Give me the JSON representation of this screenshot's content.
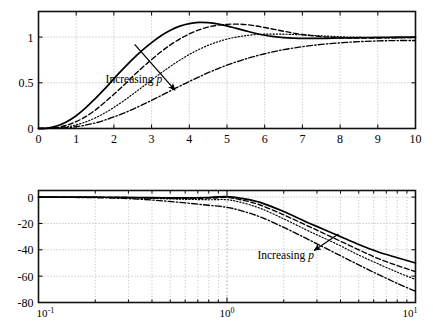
{
  "figure": {
    "title": "",
    "background": "#ffffff",
    "line_color": "#000000",
    "grid_color": "#aaaaaa"
  },
  "annotations": {
    "increasing_label": "Increasing",
    "increasing_param": "p"
  },
  "chart_data": [
    {
      "type": "line",
      "id": "step-response",
      "title": "",
      "xlabel": "",
      "ylabel": "",
      "xlim": [
        0,
        10
      ],
      "ylim": [
        0,
        1.28
      ],
      "grid": true,
      "legend": "none",
      "xticks": [
        0,
        1,
        2,
        3,
        4,
        5,
        6,
        7,
        8,
        9,
        10
      ],
      "xticklabels": [
        "0",
        "1",
        "2",
        "3",
        "4",
        "5",
        "6",
        "7",
        "8",
        "9",
        "10"
      ],
      "yticks": [
        0,
        0.5,
        1
      ],
      "yticklabels": [
        "0",
        "0.5",
        "1"
      ],
      "annotation": {
        "text": "Increasing p",
        "x": 2.55,
        "y": 0.62,
        "arrow_to_x": 3.62,
        "arrow_to_y": 0.42
      },
      "series": [
        {
          "name": "p1",
          "style": "solid",
          "x": [
            0,
            0.25,
            0.5,
            0.75,
            1.0,
            1.25,
            1.5,
            1.75,
            2.0,
            2.25,
            2.5,
            2.75,
            3.0,
            3.25,
            3.5,
            3.75,
            4.0,
            4.25,
            4.5,
            4.75,
            5.0,
            5.25,
            5.5,
            5.75,
            6.0,
            6.25,
            6.5,
            6.75,
            7.0,
            7.5,
            8.0,
            8.5,
            9.0,
            9.5,
            10.0
          ],
          "y": [
            0,
            0.005,
            0.03,
            0.075,
            0.14,
            0.225,
            0.325,
            0.43,
            0.545,
            0.655,
            0.76,
            0.855,
            0.94,
            1.015,
            1.075,
            1.12,
            1.148,
            1.16,
            1.158,
            1.145,
            1.122,
            1.095,
            1.068,
            1.042,
            1.02,
            1.005,
            0.995,
            0.989,
            0.986,
            0.986,
            0.99,
            0.994,
            0.997,
            0.999,
            1.0
          ]
        },
        {
          "name": "p2",
          "style": "dashed",
          "x": [
            0,
            0.25,
            0.5,
            0.75,
            1.0,
            1.25,
            1.5,
            1.75,
            2.0,
            2.25,
            2.5,
            2.75,
            3.0,
            3.25,
            3.5,
            3.75,
            4.0,
            4.25,
            4.5,
            4.75,
            5.0,
            5.25,
            5.5,
            5.75,
            6.0,
            6.25,
            6.5,
            6.75,
            7.0,
            7.5,
            8.0,
            8.5,
            9.0,
            9.5,
            10.0
          ],
          "y": [
            0,
            0.002,
            0.012,
            0.035,
            0.075,
            0.13,
            0.2,
            0.285,
            0.375,
            0.47,
            0.57,
            0.665,
            0.755,
            0.84,
            0.915,
            0.98,
            1.035,
            1.078,
            1.11,
            1.13,
            1.14,
            1.142,
            1.136,
            1.123,
            1.105,
            1.085,
            1.064,
            1.045,
            1.028,
            1.005,
            0.993,
            0.989,
            0.99,
            0.993,
            0.996
          ]
        },
        {
          "name": "p3",
          "style": "dotted",
          "x": [
            0,
            0.25,
            0.5,
            0.75,
            1.0,
            1.25,
            1.5,
            1.75,
            2.0,
            2.25,
            2.5,
            2.75,
            3.0,
            3.25,
            3.5,
            3.75,
            4.0,
            4.25,
            4.5,
            4.75,
            5.0,
            5.25,
            5.5,
            5.75,
            6.0,
            6.5,
            7.0,
            7.5,
            8.0,
            8.5,
            9.0,
            9.5,
            10.0
          ],
          "y": [
            0,
            0.001,
            0.006,
            0.018,
            0.04,
            0.072,
            0.115,
            0.168,
            0.23,
            0.3,
            0.375,
            0.452,
            0.53,
            0.607,
            0.68,
            0.748,
            0.81,
            0.864,
            0.91,
            0.948,
            0.978,
            1.0,
            1.016,
            1.027,
            1.032,
            1.032,
            1.024,
            1.014,
            1.004,
            0.997,
            0.993,
            0.992,
            0.993
          ]
        },
        {
          "name": "p4",
          "style": "dashdot",
          "x": [
            0,
            0.25,
            0.5,
            0.75,
            1.0,
            1.25,
            1.5,
            1.75,
            2.0,
            2.25,
            2.5,
            2.75,
            3.0,
            3.25,
            3.5,
            3.75,
            4.0,
            4.25,
            4.5,
            4.75,
            5.0,
            5.5,
            6.0,
            6.5,
            7.0,
            7.5,
            8.0,
            8.5,
            9.0,
            9.5,
            10.0
          ],
          "y": [
            0,
            0.0005,
            0.003,
            0.009,
            0.02,
            0.037,
            0.06,
            0.09,
            0.126,
            0.166,
            0.21,
            0.258,
            0.308,
            0.36,
            0.412,
            0.464,
            0.515,
            0.563,
            0.61,
            0.653,
            0.693,
            0.762,
            0.818,
            0.862,
            0.895,
            0.92,
            0.937,
            0.95,
            0.958,
            0.962,
            0.963
          ]
        }
      ]
    },
    {
      "type": "line",
      "id": "bode-magnitude",
      "title": "",
      "xlabel": "",
      "ylabel": "",
      "xscale": "log",
      "xlim": [
        0.1,
        10
      ],
      "ylim": [
        -80,
        5
      ],
      "grid": true,
      "legend": "none",
      "xticks": [
        0.1,
        1,
        10
      ],
      "xticklabels": [
        "10-1",
        "100",
        "101"
      ],
      "xtick_bases": [
        "10",
        "10",
        "10"
      ],
      "xtick_exponents": [
        "-1",
        "0",
        "1"
      ],
      "yticks": [
        0,
        -20,
        -40,
        -60,
        -80
      ],
      "yticklabels": [
        "0",
        "-20",
        "-40",
        "-60",
        "-80"
      ],
      "annotation": {
        "text": "Increasing p",
        "x": 2.15,
        "y": -47,
        "arrow_to_x": 2.9,
        "arrow_to_y": -22
      },
      "series": [
        {
          "name": "p1",
          "style": "solid",
          "x": [
            0.1,
            0.14,
            0.2,
            0.28,
            0.4,
            0.56,
            0.8,
            1.0,
            1.2,
            1.5,
            2.0,
            2.6,
            3.2,
            4.0,
            5.0,
            6.3,
            8.0,
            10.0
          ],
          "y": [
            -0.02,
            -0.05,
            -0.1,
            -0.2,
            -0.4,
            -0.6,
            -0.3,
            0.4,
            -1.0,
            -4.0,
            -11.0,
            -18.5,
            -24.0,
            -30.0,
            -36.0,
            -41.5,
            -46.0,
            -50.0
          ]
        },
        {
          "name": "p2",
          "style": "dashed",
          "x": [
            0.1,
            0.14,
            0.2,
            0.28,
            0.4,
            0.56,
            0.8,
            1.0,
            1.2,
            1.5,
            2.0,
            2.6,
            3.2,
            4.0,
            5.0,
            6.3,
            8.0,
            10.0
          ],
          "y": [
            -0.03,
            -0.06,
            -0.15,
            -0.3,
            -0.6,
            -0.9,
            -0.8,
            -0.3,
            -2.2,
            -6.0,
            -13.5,
            -21.0,
            -27.0,
            -33.5,
            -40.0,
            -46.5,
            -52.0,
            -56.5
          ]
        },
        {
          "name": "p3",
          "style": "dotted",
          "x": [
            0.1,
            0.14,
            0.2,
            0.28,
            0.4,
            0.56,
            0.8,
            1.0,
            1.2,
            1.5,
            2.0,
            2.6,
            3.2,
            4.0,
            5.0,
            6.3,
            8.0,
            10.0
          ],
          "y": [
            -0.05,
            -0.1,
            -0.22,
            -0.45,
            -0.95,
            -1.6,
            -2.0,
            -2.0,
            -4.2,
            -8.5,
            -16.5,
            -24.5,
            -30.5,
            -37.0,
            -44.0,
            -50.5,
            -57.0,
            -62.5
          ]
        },
        {
          "name": "p4",
          "style": "dashdot",
          "x": [
            0.1,
            0.14,
            0.2,
            0.28,
            0.4,
            0.56,
            0.8,
            1.0,
            1.2,
            1.5,
            2.0,
            2.6,
            3.2,
            4.0,
            5.0,
            6.3,
            8.0,
            10.0
          ],
          "y": [
            -0.1,
            -0.2,
            -0.45,
            -1.0,
            -2.2,
            -4.0,
            -6.2,
            -7.8,
            -10.5,
            -15.0,
            -23.0,
            -31.0,
            -37.5,
            -44.5,
            -51.5,
            -58.5,
            -65.5,
            -71.5
          ]
        }
      ]
    }
  ]
}
